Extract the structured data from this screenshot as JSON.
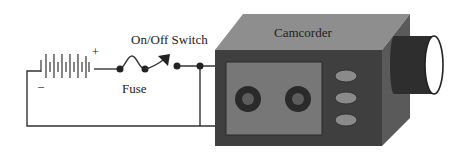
{
  "diagram": {
    "labels": {
      "switch": "On/Off Switch",
      "fuse": "Fuse",
      "device": "Camcorder",
      "plus": "+",
      "minus": "–"
    },
    "components": [
      "battery",
      "fuse",
      "on-off-switch",
      "camcorder"
    ],
    "colors": {
      "wire": "#333333",
      "body_front": "#3f3f3f",
      "body_top": "#8e8e8e",
      "body_side": "#5a5a5a",
      "screen": "#777777",
      "reel_outer": "#2a2a2a",
      "reel_inner": "#5c5c5c",
      "button": "#8a8a8a",
      "lens": "#2e2e2e"
    }
  }
}
